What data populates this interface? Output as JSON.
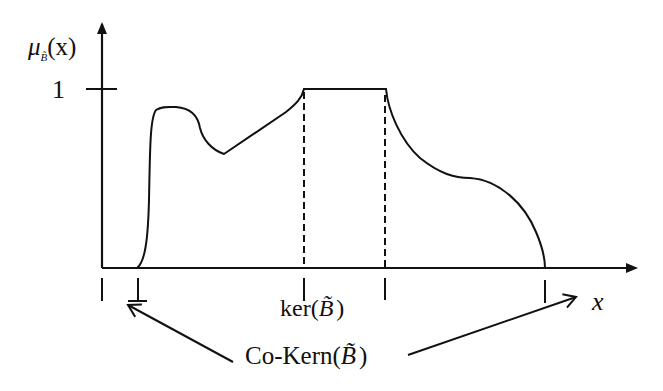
{
  "diagram": {
    "type": "fuzzy-membership-function",
    "y_axis": {
      "label_mu": "μ",
      "label_sub": "B̃",
      "label_arg": "(x)",
      "tick_label": "1"
    },
    "x_axis": {
      "label": "x"
    },
    "annotations": {
      "kernel_label_prefix": "ker(",
      "kernel_label_symbol": "B̃",
      "kernel_label_suffix": ")",
      "cokernel_label_prefix": "Co-Kern(",
      "cokernel_label_symbol": "B̃",
      "cokernel_label_suffix": ")"
    },
    "colors": {
      "stroke": "#111111",
      "background": "#ffffff"
    }
  }
}
